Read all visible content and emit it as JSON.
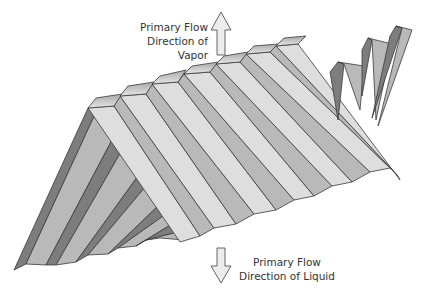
{
  "diagram": {
    "labels": {
      "vapor": [
        "Primary Flow",
        "Direction of Vapor"
      ],
      "liquid": [
        "Primary Flow",
        "Direction of Liquid"
      ]
    },
    "arrows": [
      {
        "name": "vapor-flow-arrow",
        "direction": "up"
      },
      {
        "name": "liquid-flow-arrow",
        "direction": "down"
      }
    ],
    "colors": {
      "light_face": "#dedede",
      "mid_face": "#b9b9b9",
      "dark_face": "#7d7d7d",
      "outline": "#3a3a3a",
      "arrow_fill": "#ececec"
    }
  }
}
